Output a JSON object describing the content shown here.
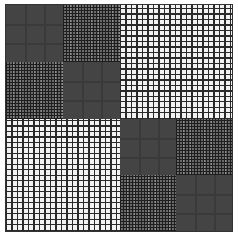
{
  "figure": {
    "quadrants": [
      {
        "position": "top-left",
        "type": "checkerboard",
        "cells": [
          [
            "light",
            "dark"
          ],
          [
            "dark",
            "light"
          ]
        ]
      },
      {
        "position": "top-right",
        "type": "open-grid"
      },
      {
        "position": "bottom-left",
        "type": "open-grid"
      },
      {
        "position": "bottom-right",
        "type": "checkerboard",
        "cells": [
          [
            "light",
            "dark"
          ],
          [
            "dark",
            "light"
          ]
        ]
      }
    ],
    "colors": {
      "light_fill": "#e4e4e4",
      "dark_fill": "#6a6a6a",
      "grid_line": "#2a2a2a",
      "background": "#ffffff"
    }
  }
}
